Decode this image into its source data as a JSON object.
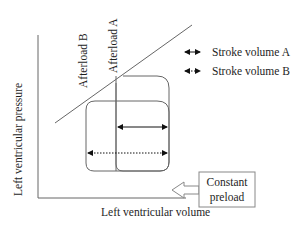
{
  "diagram": {
    "axes": {
      "y_label": "Left ventricular pressure",
      "x_label": "Left ventricular volume"
    },
    "afterload_lines": {
      "a_label": "Afterload A",
      "b_label": "Afterload B"
    },
    "legend": [
      {
        "label": "Stroke volume A",
        "style": "solid"
      },
      {
        "label": "Stroke volume B",
        "style": "dotted"
      }
    ],
    "loops": [
      {
        "name": "Loop A",
        "stroke_volume_style": "solid"
      },
      {
        "name": "Loop B",
        "stroke_volume_style": "dotted"
      }
    ],
    "preload_box": {
      "line1": "Constant",
      "line2": "preload"
    },
    "colors": {
      "line": "#555555",
      "text": "#1e1e1e",
      "arrow": "#111111"
    }
  }
}
